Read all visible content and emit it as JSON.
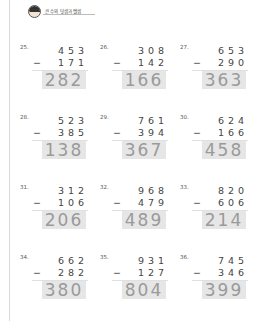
{
  "header": {
    "title": "큰 수의 덧셈과 뺄셈",
    "icon": "boy-avatar-icon"
  },
  "problems": [
    {
      "number": "25.",
      "top": [
        "4",
        "5",
        "3"
      ],
      "sub": [
        "1",
        "7",
        "1"
      ],
      "answer": "282"
    },
    {
      "number": "26.",
      "top": [
        "3",
        "0",
        "8"
      ],
      "sub": [
        "1",
        "4",
        "2"
      ],
      "answer": "166"
    },
    {
      "number": "27.",
      "top": [
        "6",
        "5",
        "3"
      ],
      "sub": [
        "2",
        "9",
        "0"
      ],
      "answer": "363"
    },
    {
      "number": "28.",
      "top": [
        "5",
        "2",
        "3"
      ],
      "sub": [
        "3",
        "8",
        "5"
      ],
      "answer": "138"
    },
    {
      "number": "29.",
      "top": [
        "7",
        "6",
        "1"
      ],
      "sub": [
        "3",
        "9",
        "4"
      ],
      "answer": "367"
    },
    {
      "number": "30.",
      "top": [
        "6",
        "2",
        "4"
      ],
      "sub": [
        "1",
        "6",
        "6"
      ],
      "answer": "458"
    },
    {
      "number": "31.",
      "top": [
        "3",
        "1",
        "2"
      ],
      "sub": [
        "1",
        "0",
        "6"
      ],
      "answer": "206"
    },
    {
      "number": "32.",
      "top": [
        "9",
        "6",
        "8"
      ],
      "sub": [
        "4",
        "7",
        "9"
      ],
      "answer": "489"
    },
    {
      "number": "33.",
      "top": [
        "8",
        "2",
        "0"
      ],
      "sub": [
        "6",
        "0",
        "6"
      ],
      "answer": "214"
    },
    {
      "number": "34.",
      "top": [
        "6",
        "6",
        "2"
      ],
      "sub": [
        "2",
        "8",
        "2"
      ],
      "answer": "380"
    },
    {
      "number": "35.",
      "top": [
        "9",
        "3",
        "1"
      ],
      "sub": [
        "1",
        "2",
        "7"
      ],
      "answer": "804"
    },
    {
      "number": "36.",
      "top": [
        "7",
        "4",
        "5"
      ],
      "sub": [
        "3",
        "4",
        "6"
      ],
      "answer": "399"
    }
  ],
  "operator": "−"
}
